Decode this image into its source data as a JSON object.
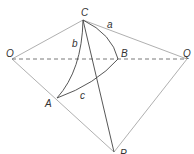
{
  "diagram": {
    "type": "spherical-triangle-construction",
    "colors": {
      "outline": "#b0b0b0",
      "arc": "#444444",
      "label": "#333333"
    },
    "points": {
      "O": {
        "label": "O",
        "x": 12,
        "y": 59
      },
      "Q": {
        "label": "Q",
        "x": 187,
        "y": 59
      },
      "C": {
        "label": "C",
        "x": 83,
        "y": 20
      },
      "B": {
        "label": "B",
        "x": 118,
        "y": 59
      },
      "A": {
        "label": "A",
        "x": 57,
        "y": 98
      },
      "P": {
        "label": "P",
        "x": 114,
        "y": 152
      }
    },
    "sides": {
      "a": {
        "label": "a"
      },
      "b": {
        "label": "b"
      },
      "c": {
        "label": "c"
      }
    }
  }
}
